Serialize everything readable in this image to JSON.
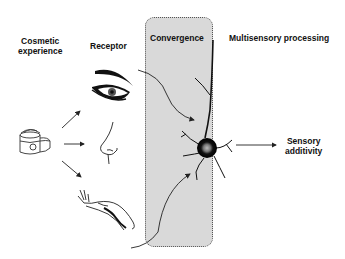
{
  "diagram": {
    "columns": {
      "cosmetic": "Cosmetic\nexperience",
      "cosmetic_line1": "Cosmetic",
      "cosmetic_line2": "experience",
      "receptor": "Receptor",
      "convergence": "Convergence",
      "multisensory": "Multisensory processing"
    },
    "output": {
      "line1": "Sensory",
      "line2": "additivity"
    },
    "icons": {
      "source": "cream-jar-icon",
      "receptors": [
        "eye-icon",
        "nose-icon",
        "hand-icon"
      ],
      "processor": "neuron-icon"
    },
    "colors": {
      "convergence_fill": "#d9d9d9",
      "ink": "#111111"
    }
  }
}
